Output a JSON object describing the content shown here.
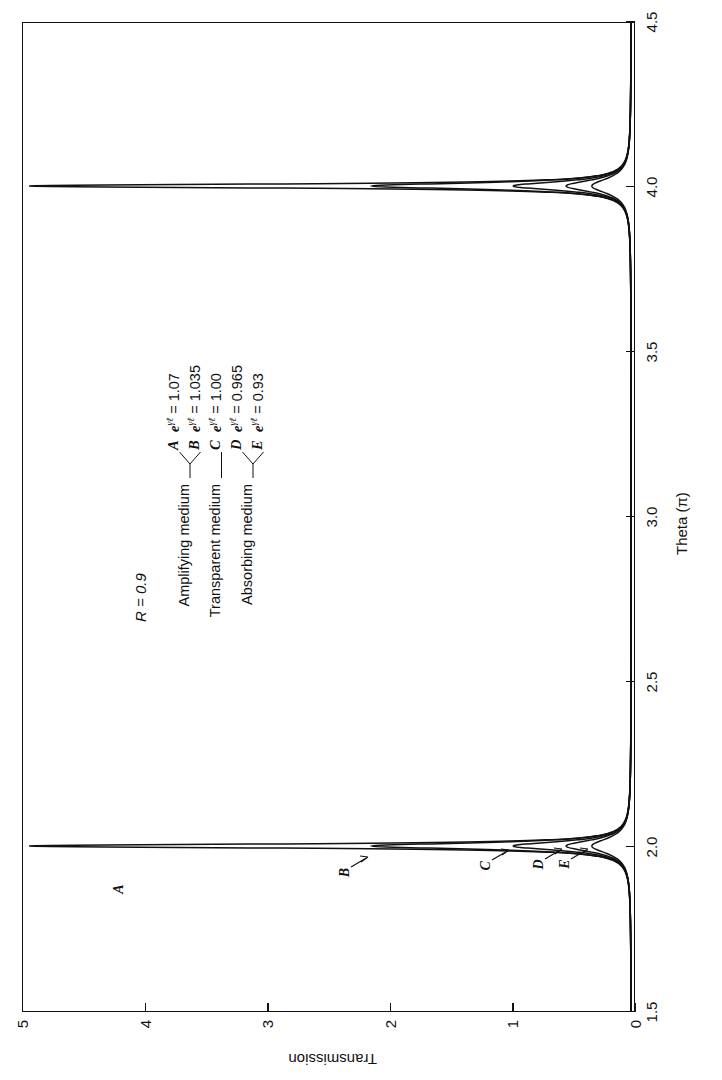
{
  "chart_data": {
    "type": "line",
    "title": "",
    "xlabel": "Theta (π)",
    "ylabel": "Transmission",
    "xlim": [
      1.5,
      4.5
    ],
    "ylim": [
      0,
      5
    ],
    "xticks": [
      1.5,
      2.0,
      2.5,
      3.0,
      3.5,
      4.0,
      4.5
    ],
    "xticklabels": [
      "1.5",
      "2.0",
      "2.5",
      "3.0",
      "3.5",
      "4.0",
      "4.5"
    ],
    "yticks": [
      0,
      1,
      2,
      3,
      4,
      5
    ],
    "yticklabels": [
      "0",
      "1",
      "2",
      "3",
      "4",
      "5"
    ],
    "grid": false,
    "legend_position": "upper-center-inside",
    "annotations": {
      "reflectivity": "R = 0.9"
    },
    "resonances": [
      2.0,
      4.0
    ],
    "baseline_transmission": 0.04,
    "series": [
      {
        "name": "A",
        "medium": "Amplifying medium",
        "gain": "1.07",
        "peak_transmission": 4.95,
        "half_width_pi": 0.0075
      },
      {
        "name": "B",
        "medium": "Amplifying medium",
        "gain": "1.035",
        "peak_transmission": 2.15,
        "half_width_pi": 0.012
      },
      {
        "name": "C",
        "medium": "Transparent medium",
        "gain": "1.00",
        "peak_transmission": 1.0,
        "half_width_pi": 0.017
      },
      {
        "name": "D",
        "medium": "Absorbing medium",
        "gain": "0.965",
        "peak_transmission": 0.57,
        "half_width_pi": 0.023
      },
      {
        "name": "E",
        "medium": "Absorbing medium",
        "gain": "0.93",
        "peak_transmission": 0.36,
        "half_width_pi": 0.029
      }
    ],
    "legend_entries": [
      {
        "medium": "Amplifying medium",
        "curves": [
          "A",
          "B"
        ],
        "values": [
          "1.07",
          "1.035"
        ]
      },
      {
        "medium": "Transparent medium",
        "curves": [
          "C"
        ],
        "values": [
          "1.00"
        ]
      },
      {
        "medium": "Absorbing medium",
        "curves": [
          "D",
          "E"
        ],
        "values": [
          "0.965",
          "0.93"
        ]
      }
    ],
    "equation_symbol": "e",
    "equation_exponent": "γℓ",
    "curve_callouts": [
      {
        "label": "A",
        "theta": 1.925,
        "transmission": 4.0
      },
      {
        "label": "B",
        "theta": 1.975,
        "transmission": 2.15
      },
      {
        "label": "C",
        "theta": 1.9955,
        "transmission": 1.0
      },
      {
        "label": "D",
        "theta": 1.9985,
        "transmission": 0.57
      },
      {
        "label": "E",
        "theta": 2.0005,
        "transmission": 0.36
      }
    ]
  }
}
